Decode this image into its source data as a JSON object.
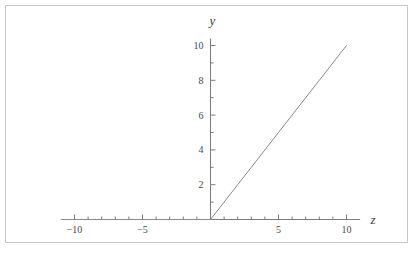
{
  "figure": {
    "background_color": "#ffffff",
    "frame_color": "#c9c9c9",
    "axis_color": "#7c7c7c",
    "curve_color": "#8a8a8a",
    "label_color": "#3a3a3a"
  },
  "chart_data": {
    "type": "line",
    "title": "",
    "xlabel": "z",
    "ylabel": "y",
    "xlim": [
      -11,
      11
    ],
    "ylim": [
      0,
      10.4
    ],
    "grid": false,
    "legend": null,
    "x_major_ticks": [
      -10,
      -5,
      5,
      10
    ],
    "x_major_tick_labels": [
      "-10",
      "-5",
      "5",
      "10"
    ],
    "x_minor_ticks": [
      -9,
      -8,
      -7,
      -6,
      -4,
      -3,
      -2,
      -1,
      1,
      2,
      3,
      4,
      6,
      7,
      8,
      9
    ],
    "y_major_ticks": [
      2,
      4,
      6,
      8,
      10
    ],
    "y_major_tick_labels": [
      "2",
      "4",
      "6",
      "8",
      "10"
    ],
    "y_minor_ticks": [
      1,
      3,
      5,
      7,
      9
    ],
    "series": [
      {
        "name": "ReLU",
        "expression": "y = max(0, z)",
        "x": [
          -11,
          -10,
          -9,
          -8,
          -7,
          -6,
          -5,
          -4,
          -3,
          -2,
          -1,
          0,
          1,
          2,
          3,
          4,
          5,
          6,
          7,
          8,
          9,
          10
        ],
        "values": [
          0,
          0,
          0,
          0,
          0,
          0,
          0,
          0,
          0,
          0,
          0,
          0,
          1,
          2,
          3,
          4,
          5,
          6,
          7,
          8,
          9,
          10
        ]
      }
    ]
  }
}
